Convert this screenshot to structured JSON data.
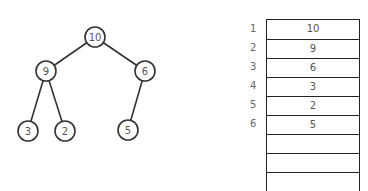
{
  "tree": {
    "nodes": [
      {
        "id": "n1",
        "label": "10",
        "x": 95,
        "y": 37
      },
      {
        "id": "n2",
        "label": "9",
        "x": 46,
        "y": 71
      },
      {
        "id": "n3",
        "label": "6",
        "x": 145,
        "y": 71
      },
      {
        "id": "n4",
        "label": "3",
        "x": 28,
        "y": 131
      },
      {
        "id": "n5",
        "label": "2",
        "x": 65,
        "y": 131
      },
      {
        "id": "n6",
        "label": "5",
        "x": 128,
        "y": 130
      }
    ],
    "edges": [
      [
        "n1",
        "n2"
      ],
      [
        "n1",
        "n3"
      ],
      [
        "n2",
        "n4"
      ],
      [
        "n2",
        "n5"
      ],
      [
        "n3",
        "n6"
      ]
    ]
  },
  "array": {
    "indices": [
      "1",
      "2",
      "3",
      "4",
      "5",
      "6",
      "",
      "",
      ""
    ],
    "values": [
      "10",
      "9",
      "6",
      "3",
      "2",
      "5",
      "",
      "",
      ""
    ]
  }
}
